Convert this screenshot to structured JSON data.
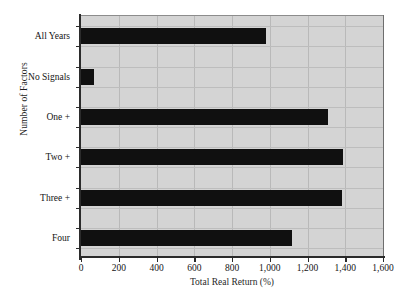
{
  "chart_data": {
    "type": "bar",
    "orientation": "horizontal",
    "title": "",
    "xlabel": "Total Real Return (%)",
    "ylabel": "Number of Factors",
    "categories": [
      "All Years",
      "No Signals",
      "One +",
      "Two +",
      "Three +",
      "Four"
    ],
    "values": [
      980,
      70,
      1310,
      1390,
      1385,
      1120
    ],
    "xlim": [
      0,
      1600
    ],
    "xticks": [
      0,
      200,
      400,
      600,
      800,
      1000,
      1200,
      1400,
      1600
    ],
    "xtick_labels": [
      "0",
      "200",
      "400",
      "600",
      "800",
      "1,000",
      "1,200",
      "1,400",
      "1,600"
    ],
    "grid": true,
    "grid_axis": "both",
    "legend": false,
    "bar_color": "#101010",
    "plot_background": "#d4d4d4",
    "figure_background": "#ffffff",
    "gridline_color": "#bdbdbd",
    "axis_color": "#2b2b2b",
    "series": [
      {
        "name": "Total Real Return (%)",
        "values": [
          980,
          70,
          1310,
          1390,
          1385,
          1120
        ]
      }
    ]
  }
}
